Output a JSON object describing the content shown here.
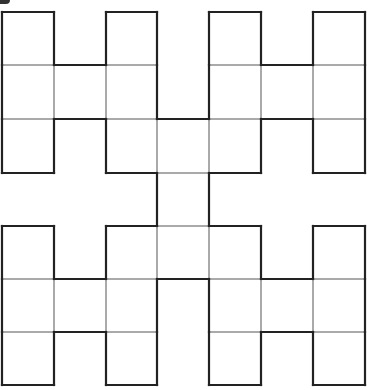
{
  "diagram": {
    "type": "polyomino-h-tree",
    "grid": {
      "cols": 7,
      "rows": 7
    },
    "col_edges": [
      2,
      54,
      106,
      157,
      209,
      261,
      313,
      365
    ],
    "row_edges": [
      12,
      65,
      119,
      173,
      226,
      279,
      332,
      385
    ],
    "cells": [
      [
        0,
        0
      ],
      [
        0,
        1
      ],
      [
        0,
        2
      ],
      [
        1,
        1
      ],
      [
        2,
        0
      ],
      [
        2,
        1
      ],
      [
        2,
        2
      ],
      [
        4,
        0
      ],
      [
        4,
        1
      ],
      [
        4,
        2
      ],
      [
        5,
        1
      ],
      [
        6,
        0
      ],
      [
        6,
        1
      ],
      [
        6,
        2
      ],
      [
        3,
        2
      ],
      [
        3,
        3
      ],
      [
        3,
        4
      ],
      [
        0,
        4
      ],
      [
        0,
        5
      ],
      [
        0,
        6
      ],
      [
        1,
        5
      ],
      [
        2,
        4
      ],
      [
        2,
        5
      ],
      [
        2,
        6
      ],
      [
        4,
        4
      ],
      [
        4,
        5
      ],
      [
        4,
        6
      ],
      [
        5,
        5
      ],
      [
        6,
        4
      ],
      [
        6,
        5
      ],
      [
        6,
        6
      ]
    ],
    "colors": {
      "outline": "#222222",
      "inner_lines": "#555555",
      "fill": "#ffffff"
    }
  }
}
